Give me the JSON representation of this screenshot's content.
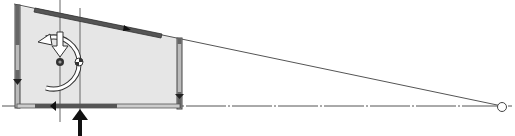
{
  "diagram": {
    "type": "structural-force-diagram",
    "colors": {
      "background": "#ffffff",
      "fill": "#e6e6e6",
      "wall": "#555555",
      "wall_light": "#bbbbbb",
      "line": "#444444",
      "arrow": "#111111"
    },
    "elements": [
      {
        "name": "shaded-panel"
      },
      {
        "name": "left-wall"
      },
      {
        "name": "top-wall-sloped"
      },
      {
        "name": "right-wall"
      },
      {
        "name": "bottom-wall"
      },
      {
        "name": "extension-line-top"
      },
      {
        "name": "baseline-dash-dot"
      },
      {
        "name": "vertical-axis-left"
      },
      {
        "name": "vertical-axis-right"
      },
      {
        "name": "rotation-arrow"
      },
      {
        "name": "down-force-arrow"
      },
      {
        "name": "center-of-mass-marker"
      },
      {
        "name": "center-of-rigidity-marker"
      },
      {
        "name": "lateral-load-arrow"
      },
      {
        "name": "pivot-circle"
      }
    ]
  }
}
